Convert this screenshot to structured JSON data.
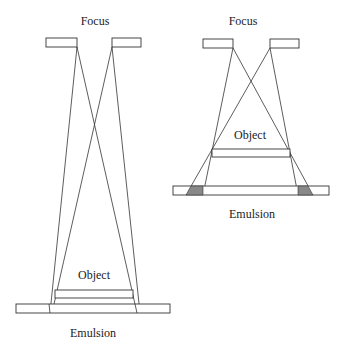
{
  "diagrams": [
    {
      "id": "left",
      "focus_label": "Focus",
      "object_label": "Object",
      "emulsion_label": "Emulsion",
      "description": "Object close to emulsion, far from focal spot: minimal penumbra"
    },
    {
      "id": "right",
      "focus_label": "Focus",
      "object_label": "Object",
      "emulsion_label": "Emulsion",
      "description": "Object far from emulsion, close to focal spot: large shaded penumbra"
    }
  ],
  "colors": {
    "line": "#333333",
    "penumbra": "#888888",
    "background": "#ffffff"
  }
}
